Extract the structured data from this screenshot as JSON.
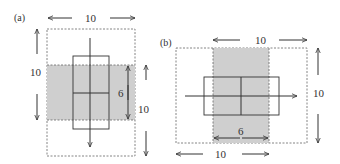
{
  "figure": {
    "panel_a": {
      "label": "(a)",
      "outer_width_label": "10",
      "outer_height_label": "10",
      "band_height_label": "6",
      "band_span_label": "10",
      "flow_direction": "down"
    },
    "panel_b": {
      "label": "(b)",
      "top_width_label": "10",
      "side_height_label": "10",
      "band_width_label": "6",
      "bottom_width_label": "10",
      "flow_direction": "right"
    },
    "colors": {
      "band_fill": "#cfcfcf",
      "stroke": "#333333",
      "dashed": "#666666"
    }
  }
}
